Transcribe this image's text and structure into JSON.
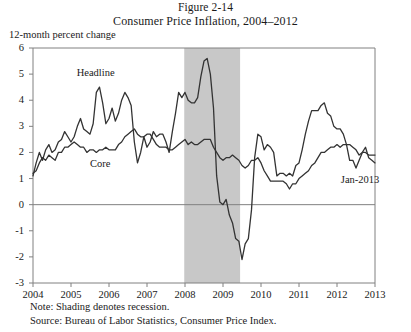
{
  "figure": {
    "number_line": "Figure 2-14",
    "title": "Consumer Price Inflation, 2004–2012",
    "unit_label": "12-month percent change",
    "note": "Note: Shading denotes recession.",
    "source": "Source: Bureau of Labor Statistics, Consumer Price Index.",
    "endpoint_label": "Jan-2013",
    "colors": {
      "line": "#333333",
      "axis": "#808080",
      "shading": "#c8c8c8",
      "text": "#1a1a1a"
    }
  },
  "chart_data": {
    "type": "line",
    "title": "Consumer Price Inflation, 2004–2012",
    "subtitle": "Figure 2-14",
    "xlabel": "",
    "ylabel": "12-month percent change",
    "xlim": [
      2004,
      2013
    ],
    "ylim": [
      -3,
      6
    ],
    "yticks": [
      6,
      5,
      4,
      3,
      2,
      1,
      0,
      -1,
      -2,
      -3
    ],
    "ytick_labels": [
      "6",
      "5",
      "4",
      "3",
      "2",
      "1",
      "0",
      "-1",
      "-2",
      "-3"
    ],
    "xticks": [
      2004,
      2005,
      2006,
      2007,
      2008,
      2009,
      2010,
      2011,
      2012,
      2013
    ],
    "xtick_labels": [
      "2004",
      "2005",
      "2006",
      "2007",
      "2008",
      "2009",
      "2010",
      "2011",
      "2012",
      "2013"
    ],
    "grid": false,
    "zero_line": true,
    "legend": "inline-labels",
    "annotations": [
      {
        "text": "Headline",
        "x": 2005.15,
        "y": 5.05
      },
      {
        "text": "Core",
        "x": 2005.5,
        "y": 1.55
      },
      {
        "text": "Jan-2013",
        "x": 2012.1,
        "y": 0.95
      }
    ],
    "shaded_regions": [
      {
        "label": "recession",
        "x_start": 2007.98,
        "x_end": 2009.45,
        "color": "#c8c8c8"
      }
    ],
    "series": [
      {
        "name": "Headline",
        "color": "#333333",
        "x": [
          2004.0,
          2004.083,
          2004.167,
          2004.25,
          2004.333,
          2004.417,
          2004.5,
          2004.583,
          2004.667,
          2004.75,
          2004.833,
          2004.917,
          2005.0,
          2005.083,
          2005.167,
          2005.25,
          2005.333,
          2005.417,
          2005.5,
          2005.583,
          2005.667,
          2005.75,
          2005.833,
          2005.917,
          2006.0,
          2006.083,
          2006.167,
          2006.25,
          2006.333,
          2006.417,
          2006.5,
          2006.583,
          2006.667,
          2006.75,
          2006.833,
          2006.917,
          2007.0,
          2007.083,
          2007.167,
          2007.25,
          2007.333,
          2007.417,
          2007.5,
          2007.583,
          2007.667,
          2007.75,
          2007.833,
          2007.917,
          2008.0,
          2008.083,
          2008.167,
          2008.25,
          2008.333,
          2008.417,
          2008.5,
          2008.583,
          2008.667,
          2008.75,
          2008.833,
          2008.917,
          2009.0,
          2009.083,
          2009.167,
          2009.25,
          2009.333,
          2009.417,
          2009.5,
          2009.583,
          2009.667,
          2009.75,
          2009.833,
          2009.917,
          2010.0,
          2010.083,
          2010.167,
          2010.25,
          2010.333,
          2010.417,
          2010.5,
          2010.583,
          2010.667,
          2010.75,
          2010.833,
          2010.917,
          2011.0,
          2011.083,
          2011.167,
          2011.25,
          2011.333,
          2011.417,
          2011.5,
          2011.583,
          2011.667,
          2011.75,
          2011.833,
          2011.917,
          2012.0,
          2012.083,
          2012.167,
          2012.25,
          2012.333,
          2012.417,
          2012.5,
          2012.583,
          2012.667,
          2012.75,
          2012.833,
          2012.917,
          2013.0
        ],
        "y": [
          1.1,
          1.6,
          2.0,
          1.7,
          2.1,
          2.3,
          2.0,
          2.1,
          2.4,
          2.5,
          2.8,
          2.6,
          2.4,
          2.6,
          3.0,
          3.3,
          2.9,
          2.8,
          2.7,
          3.1,
          4.3,
          4.5,
          3.9,
          3.1,
          3.3,
          3.7,
          3.2,
          3.5,
          4.0,
          4.3,
          4.1,
          3.8,
          2.4,
          1.6,
          2.0,
          2.6,
          2.2,
          2.4,
          2.8,
          2.6,
          2.7,
          2.7,
          2.4,
          2.0,
          2.8,
          3.5,
          4.3,
          4.1,
          4.3,
          4.0,
          3.9,
          3.9,
          4.1,
          4.9,
          5.5,
          5.6,
          5.0,
          3.7,
          1.1,
          0.1,
          0.0,
          0.2,
          -0.4,
          -0.7,
          -1.3,
          -1.4,
          -2.1,
          -1.5,
          -1.3,
          -0.2,
          1.8,
          2.7,
          2.6,
          2.1,
          2.3,
          2.2,
          2.0,
          1.1,
          1.2,
          1.2,
          1.1,
          1.2,
          1.1,
          1.5,
          1.6,
          2.1,
          2.7,
          3.2,
          3.6,
          3.6,
          3.6,
          3.8,
          3.9,
          3.5,
          3.4,
          3.0,
          2.9,
          2.9,
          2.7,
          2.3,
          1.7,
          1.7,
          1.4,
          1.7,
          2.0,
          2.2,
          1.8,
          1.7,
          1.6
        ]
      },
      {
        "name": "Core",
        "color": "#333333",
        "x": [
          2004.0,
          2004.083,
          2004.167,
          2004.25,
          2004.333,
          2004.417,
          2004.5,
          2004.583,
          2004.667,
          2004.75,
          2004.833,
          2004.917,
          2005.0,
          2005.083,
          2005.167,
          2005.25,
          2005.333,
          2005.417,
          2005.5,
          2005.583,
          2005.667,
          2005.75,
          2005.833,
          2005.917,
          2006.0,
          2006.083,
          2006.167,
          2006.25,
          2006.333,
          2006.417,
          2006.5,
          2006.583,
          2006.667,
          2006.75,
          2006.833,
          2006.917,
          2007.0,
          2007.083,
          2007.167,
          2007.25,
          2007.333,
          2007.417,
          2007.5,
          2007.583,
          2007.667,
          2007.75,
          2007.833,
          2007.917,
          2008.0,
          2008.083,
          2008.167,
          2008.25,
          2008.333,
          2008.417,
          2008.5,
          2008.583,
          2008.667,
          2008.75,
          2008.833,
          2008.917,
          2009.0,
          2009.083,
          2009.167,
          2009.25,
          2009.333,
          2009.417,
          2009.5,
          2009.583,
          2009.667,
          2009.75,
          2009.833,
          2009.917,
          2010.0,
          2010.083,
          2010.167,
          2010.25,
          2010.333,
          2010.417,
          2010.5,
          2010.583,
          2010.667,
          2010.75,
          2010.833,
          2010.917,
          2011.0,
          2011.083,
          2011.167,
          2011.25,
          2011.333,
          2011.417,
          2011.5,
          2011.583,
          2011.667,
          2011.75,
          2011.833,
          2011.917,
          2012.0,
          2012.083,
          2012.167,
          2012.25,
          2012.333,
          2012.417,
          2012.5,
          2012.583,
          2012.667,
          2012.75,
          2012.833,
          2012.917,
          2013.0
        ],
        "y": [
          1.2,
          1.3,
          1.6,
          1.8,
          1.7,
          1.9,
          1.8,
          1.7,
          2.0,
          2.0,
          2.2,
          2.2,
          2.3,
          2.4,
          2.3,
          2.2,
          2.2,
          2.0,
          2.1,
          2.1,
          2.0,
          2.1,
          2.1,
          2.2,
          2.1,
          2.1,
          2.1,
          2.3,
          2.4,
          2.6,
          2.7,
          2.8,
          2.9,
          2.7,
          2.6,
          2.6,
          2.7,
          2.7,
          2.5,
          2.3,
          2.2,
          2.2,
          2.2,
          2.1,
          2.1,
          2.2,
          2.3,
          2.4,
          2.5,
          2.3,
          2.4,
          2.3,
          2.3,
          2.4,
          2.5,
          2.5,
          2.5,
          2.2,
          2.0,
          1.8,
          1.7,
          1.8,
          1.8,
          1.9,
          1.8,
          1.7,
          1.5,
          1.4,
          1.5,
          1.7,
          1.7,
          1.8,
          1.6,
          1.3,
          1.1,
          0.9,
          0.9,
          0.9,
          0.9,
          0.9,
          0.8,
          0.6,
          0.8,
          0.8,
          1.0,
          1.1,
          1.2,
          1.3,
          1.5,
          1.6,
          1.8,
          2.0,
          2.0,
          2.1,
          2.2,
          2.2,
          2.3,
          2.2,
          2.3,
          2.3,
          2.3,
          2.2,
          2.1,
          1.9,
          2.0,
          2.0,
          1.9,
          1.9,
          1.9
        ]
      }
    ]
  }
}
